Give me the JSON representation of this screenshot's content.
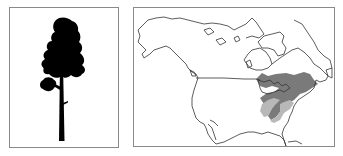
{
  "figure": {
    "tree_panel": {
      "label": "Tree silhouette",
      "icon": "tree-silhouette-icon",
      "color": "#000000"
    },
    "map_panel": {
      "label": "North America range map",
      "regions": [
        {
          "name": "primary-range",
          "color": "#7a7a7a"
        },
        {
          "name": "secondary-range",
          "color": "#b8b8b8"
        }
      ],
      "outline_color": "#333333"
    }
  }
}
